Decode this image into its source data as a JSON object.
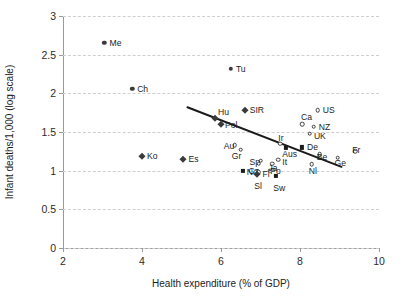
{
  "chart_data": {
    "type": "scatter",
    "title": "",
    "xlabel": "Health expenditure (% of GDP)",
    "ylabel": "Infant deaths/1,000 (log scale)",
    "xlim": [
      2,
      10
    ],
    "ylim": [
      0,
      3
    ],
    "xticks": [
      "2",
      "4",
      "6",
      "8",
      "10"
    ],
    "xtick_values": [
      2,
      4,
      6,
      8,
      10
    ],
    "yticks": [
      "0",
      "0.5",
      "1",
      "1.5",
      "2",
      "2.5",
      "3"
    ],
    "ytick_values": [
      0,
      0.5,
      1,
      1.5,
      2,
      2.5,
      3
    ],
    "grid": "horizontal-dashed",
    "legend": "none",
    "points": [
      {
        "label": "Me",
        "x": 3.05,
        "y": 2.65,
        "marker": "filled-circle",
        "lx": 5,
        "ly": -4
      },
      {
        "label": "Tu",
        "x": 6.25,
        "y": 2.32,
        "marker": "filled-circle",
        "lx": 5,
        "ly": -4
      },
      {
        "label": "Ch",
        "x": 3.75,
        "y": 2.06,
        "marker": "filled-circle",
        "lx": 5,
        "ly": -4
      },
      {
        "label": "SIR",
        "x": 6.6,
        "y": 1.78,
        "marker": "diamond",
        "lx": 5,
        "ly": -4
      },
      {
        "label": "Hu",
        "x": 5.85,
        "y": 1.68,
        "marker": "diamond",
        "lx": 3,
        "ly": -10
      },
      {
        "label": "Pol",
        "x": 6.0,
        "y": 1.6,
        "marker": "diamond",
        "lx": 4,
        "ly": -3
      },
      {
        "label": "US",
        "x": 8.45,
        "y": 1.78,
        "marker": "open-circle",
        "lx": 5,
        "ly": -4
      },
      {
        "label": "Ca",
        "x": 8.05,
        "y": 1.6,
        "marker": "open-circle",
        "lx": -1,
        "ly": -11
      },
      {
        "label": "NZ",
        "x": 8.35,
        "y": 1.57,
        "marker": "open-circle",
        "lx": 5,
        "ly": -4
      },
      {
        "label": "UK",
        "x": 8.25,
        "y": 1.48,
        "marker": "open-circle",
        "lx": 4,
        "ly": -2
      },
      {
        "label": "Ko",
        "x": 4.0,
        "y": 1.19,
        "marker": "diamond",
        "lx": 5,
        "ly": -4
      },
      {
        "label": "Es",
        "x": 5.05,
        "y": 1.15,
        "marker": "diamond",
        "lx": 5,
        "ly": -4
      },
      {
        "label": "Au",
        "x": 6.35,
        "y": 1.33,
        "marker": "open-circle",
        "lx": -11,
        "ly": -3
      },
      {
        "label": "Gr",
        "x": 6.5,
        "y": 1.27,
        "marker": "open-circle",
        "lx": -9,
        "ly": 2
      },
      {
        "label": "Ir",
        "x": 7.5,
        "y": 1.35,
        "marker": "open-circle",
        "lx": -2,
        "ly": -10
      },
      {
        "label": "Aus",
        "x": 7.65,
        "y": 1.29,
        "marker": "square",
        "lx": -4,
        "ly": 2
      },
      {
        "label": "De",
        "x": 8.05,
        "y": 1.3,
        "marker": "square",
        "lx": 5,
        "ly": -4
      },
      {
        "label": "Be",
        "x": 8.5,
        "y": 1.21,
        "marker": "open-circle",
        "lx": -3,
        "ly": -1
      },
      {
        "label": "Ge",
        "x": 8.95,
        "y": 1.17,
        "marker": "open-circle",
        "lx": -3,
        "ly": 1
      },
      {
        "label": "Fr",
        "x": 9.4,
        "y": 1.25,
        "marker": "open-circle",
        "lx": -3,
        "ly": -5
      },
      {
        "label": "Nl",
        "x": 8.3,
        "y": 1.08,
        "marker": "open-circle",
        "lx": -3,
        "ly": 3
      },
      {
        "label": "Sp",
        "x": 7.0,
        "y": 1.13,
        "marker": "open-circle",
        "lx": -11,
        "ly": -3
      },
      {
        "label": "Cz",
        "x": 6.95,
        "y": 1.09,
        "marker": "open-circle",
        "lx": -10,
        "ly": 3
      },
      {
        "label": "It",
        "x": 7.45,
        "y": 1.14,
        "marker": "open-circle",
        "lx": 4,
        "ly": -2
      },
      {
        "label": "Po",
        "x": 7.3,
        "y": 1.09,
        "marker": "open-circle",
        "lx": -2,
        "ly": 3
      },
      {
        "label": "No",
        "x": 6.55,
        "y": 1.0,
        "marker": "square",
        "lx": 4,
        "ly": -3
      },
      {
        "label": "Fi",
        "x": 6.95,
        "y": 0.98,
        "marker": "open-circle",
        "lx": 4,
        "ly": -2
      },
      {
        "label": "Sl",
        "x": 6.92,
        "y": 0.96,
        "marker": "diamond",
        "lx": -3,
        "ly": 8
      },
      {
        "label": "Ja",
        "x": 7.25,
        "y": 1.0,
        "marker": "open-circle",
        "lx": -2,
        "ly": -7
      },
      {
        "label": "Sw",
        "x": 7.4,
        "y": 0.93,
        "marker": "square",
        "lx": -3,
        "ly": 8
      }
    ],
    "trendline": {
      "x1": 5.15,
      "y1": 1.82,
      "x2": 9.05,
      "y2": 1.05,
      "color": "#1a1a1a"
    }
  }
}
